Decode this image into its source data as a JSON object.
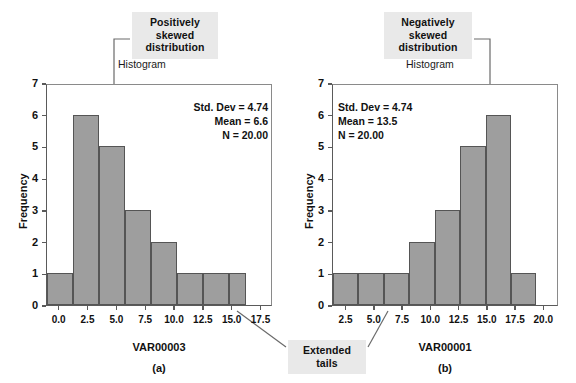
{
  "callouts": {
    "positive": {
      "line1": "Positively",
      "line2": "skewed",
      "line3": "distribution"
    },
    "negative": {
      "line1": "Negatively",
      "line2": "skewed",
      "line3": "distribution"
    },
    "tails": {
      "line1": "Extended",
      "line2": "tails"
    }
  },
  "chart_data": [
    {
      "type": "bar",
      "title": "Histogram",
      "panel_label": "(a)",
      "xlabel": "VAR00003",
      "ylabel": "Frequency",
      "xtick_labels": [
        "0.0",
        "2.5",
        "5.0",
        "7.5",
        "10.0",
        "12.5",
        "15.0",
        "17.5"
      ],
      "xtick_values": [
        0.0,
        2.5,
        5.0,
        7.5,
        10.0,
        12.5,
        15.0,
        17.5
      ],
      "ytick_labels": [
        "0",
        "1",
        "2",
        "3",
        "4",
        "5",
        "6",
        "7"
      ],
      "ylim": [
        0,
        7
      ],
      "xlim": [
        -1.1,
        18.5
      ],
      "grid": false,
      "bin_width": 2.25,
      "bin_starts": [
        -1.1,
        1.15,
        3.4,
        5.65,
        7.9,
        10.15,
        12.4,
        14.65,
        16.2
      ],
      "categories": [
        "-1.1",
        "1.15",
        "3.4",
        "5.65",
        "7.9",
        "10.15",
        "12.4",
        "14.65"
      ],
      "values": [
        1,
        6,
        5,
        3,
        2,
        1,
        1,
        1
      ],
      "stats": {
        "std_dev": "Std. Dev = 4.74",
        "mean": "Mean = 6.6",
        "n": "N = 20.00"
      }
    },
    {
      "type": "bar",
      "title": "Histogram",
      "panel_label": "(b)",
      "xlabel": "VAR00001",
      "ylabel": "Frequency",
      "xtick_labels": [
        "2.5",
        "5.0",
        "7.5",
        "10.0",
        "12.5",
        "15.0",
        "17.5",
        "20.0"
      ],
      "xtick_values": [
        2.5,
        5.0,
        7.5,
        10.0,
        12.5,
        15.0,
        17.5,
        20.0
      ],
      "ytick_labels": [
        "0",
        "1",
        "2",
        "3",
        "4",
        "5",
        "6",
        "7"
      ],
      "ylim": [
        0,
        7
      ],
      "xlim": [
        1.3,
        21.3
      ],
      "grid": false,
      "bin_width": 2.25,
      "bin_starts": [
        1.3,
        3.55,
        5.8,
        8.05,
        10.3,
        12.55,
        14.8,
        17.05,
        19.3
      ],
      "categories": [
        "1.3",
        "3.55",
        "5.8",
        "8.05",
        "10.3",
        "12.55",
        "14.8",
        "17.05"
      ],
      "values": [
        1,
        1,
        1,
        2,
        3,
        5,
        6,
        1
      ],
      "stats": {
        "std_dev": "Std. Dev = 4.74",
        "mean": "Mean = 13.5",
        "n": "N = 20.00"
      }
    }
  ],
  "colors": {
    "bar_fill": "#9e9e9e",
    "bar_stroke": "#555555",
    "axis": "#5a5a5a",
    "callout_bg": "#e9e9e9",
    "leader_line": "#6a6a6a",
    "text": "#111111",
    "background": "#ffffff"
  }
}
